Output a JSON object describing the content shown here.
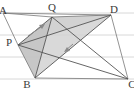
{
  "figure": {
    "kind": "geometry-diagram",
    "canvas": {
      "width": 134,
      "height": 92
    },
    "background": {
      "color": "#ffffff",
      "ruled_lines": {
        "color": "#d8d8d8",
        "y_positions": [
          13,
          35,
          57,
          79
        ]
      }
    },
    "colors": {
      "stroke": "#555555",
      "thin_stroke": "#777777",
      "label": "#3a3a3a",
      "shade_light": "#d7d7d7",
      "shade_mid": "#c9c9c9",
      "shade_dark": "#bdbdbd",
      "rule": "#d8d8d8"
    },
    "points": [
      {
        "id": "A",
        "label": "A",
        "x": 3,
        "y": 13,
        "label_x": 3,
        "label_y": 10
      },
      {
        "id": "Q",
        "label": "Q",
        "x": 52,
        "y": 17,
        "label_x": 52,
        "label_y": 7
      },
      {
        "id": "D",
        "label": "D",
        "x": 111,
        "y": 15,
        "label_x": 113,
        "label_y": 9
      },
      {
        "id": "P",
        "label": "P",
        "x": 18,
        "y": 45,
        "label_x": 10,
        "label_y": 42
      },
      {
        "id": "B",
        "label": "B",
        "x": 35,
        "y": 78,
        "label_x": 27,
        "label_y": 85
      },
      {
        "id": "C",
        "label": "C",
        "x": 128,
        "y": 79,
        "label_x": 131,
        "label_y": 85
      }
    ],
    "segments": [
      {
        "name": "A-Q",
        "from": "A",
        "to": "Q",
        "weight": "thin"
      },
      {
        "name": "Q-D",
        "from": "Q",
        "to": "D",
        "weight": "thin"
      },
      {
        "name": "A-P",
        "from": "A",
        "to": "P",
        "weight": "thin"
      },
      {
        "name": "P-B",
        "from": "P",
        "to": "B",
        "weight": "thin"
      },
      {
        "name": "B-C",
        "from": "B",
        "to": "C",
        "weight": "thin"
      },
      {
        "name": "D-C",
        "from": "D",
        "to": "C",
        "weight": "thin"
      },
      {
        "name": "P-Q",
        "from": "P",
        "to": "Q",
        "weight": "normal"
      },
      {
        "name": "Q-B",
        "from": "Q",
        "to": "B",
        "weight": "normal"
      },
      {
        "name": "B-D",
        "from": "B",
        "to": "D",
        "weight": "normal"
      },
      {
        "name": "D-P",
        "from": "D",
        "to": "P",
        "weight": "normal"
      },
      {
        "name": "P-C",
        "from": "P",
        "to": "C",
        "weight": "normal"
      },
      {
        "name": "Q-C",
        "from": "Q",
        "to": "C",
        "weight": "normal"
      },
      {
        "name": "A-D",
        "from": "A",
        "to": "D",
        "weight": "thin"
      }
    ],
    "shaded_regions": [
      {
        "name": "region-P-Q-D",
        "vertices": [
          "P",
          "Q",
          "D"
        ],
        "fill": "#cfcfcf"
      },
      {
        "name": "region-P-Q-B",
        "vertices": [
          "P",
          "Q",
          "B"
        ],
        "fill": "#c4c4c4"
      },
      {
        "name": "region-Q-B-D",
        "vertices": [
          "Q",
          "B",
          "D"
        ],
        "fill": "#d2d2d2"
      }
    ],
    "arrows": [
      {
        "name": "arrow-toward-Q",
        "x1": 28,
        "y1": 36,
        "x2": 45,
        "y2": 24,
        "color": "#8a8a8a"
      },
      {
        "name": "arrow-tick-center",
        "x1": 73,
        "y1": 44,
        "x2": 64,
        "y2": 52,
        "color": "#8a8a8a"
      }
    ]
  }
}
